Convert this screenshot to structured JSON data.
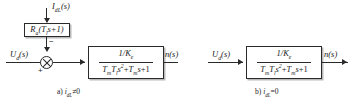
{
  "figure": {
    "type": "control-block-diagram",
    "panels": [
      {
        "id": "a",
        "caption": "a) idL≠0",
        "caption_parts": {
          "tag": "a)",
          "var": "i",
          "var_sub": "dL",
          "relation": "≠0"
        },
        "input_label": "Ud(s)",
        "output_label": "n(s)",
        "disturbance_label": "IdL(s)",
        "disturbance_block": "Ra(Tls+1)",
        "disturbance_block_parts": {
          "main": "R",
          "main_sub": "a",
          "inner": "(T",
          "inner_sub": "l",
          "tail": "s+1)"
        },
        "summing_signs": {
          "input": "+",
          "disturbance": "−"
        },
        "transfer_function": {
          "numerator": "1/Ke",
          "numerator_parts": {
            "lead": "1/K",
            "sub": "e"
          },
          "denominator": "TmTls2+Tms+1",
          "denominator_parts": {
            "t1": "T",
            "t1_sub": "m",
            "t2": "T",
            "t2_sub": "l",
            "s_pow": "s",
            "s_exp": "2",
            "plus1": "+",
            "t3": "T",
            "t3_sub": "m",
            "s2": "s",
            "tail": "+1"
          }
        }
      },
      {
        "id": "b",
        "caption": "b) idL=0",
        "caption_parts": {
          "tag": "b)",
          "var": "i",
          "var_sub": "dL",
          "relation": "=0"
        },
        "input_label": "Ud(s)",
        "output_label": "n(s)",
        "transfer_function": {
          "numerator": "1/Ke",
          "numerator_parts": {
            "lead": "1/K",
            "sub": "e"
          },
          "denominator": "TmTls2+Tms+1",
          "denominator_parts": {
            "t1": "T",
            "t1_sub": "m",
            "t2": "T",
            "t2_sub": "l",
            "s_pow": "s",
            "s_exp": "2",
            "plus1": "+",
            "t3": "T",
            "t3_sub": "m",
            "s2": "s",
            "tail": "+1"
          }
        }
      }
    ],
    "colors": {
      "line": "#2a2a2a",
      "background": "#ffffff",
      "shadow": "#828282"
    }
  }
}
